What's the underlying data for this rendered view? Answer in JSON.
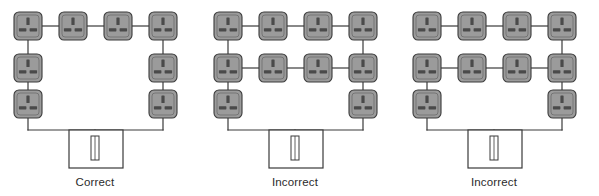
{
  "figure": {
    "background_color": "#ffffff",
    "width": 599,
    "height": 196
  },
  "style": {
    "socket_fill": "#9b9b9b",
    "socket_stroke": "#3a3a3a",
    "socket_slot_fill": "#4a4a4a",
    "wire_color": "#3a3a3a",
    "wire_width": 1.2,
    "consumer_unit_fill": "#ffffff",
    "consumer_unit_stroke": "#3a3a3a",
    "label_color": "#2b2b2b"
  },
  "icons": {
    "socket": "socket-outlet-icon",
    "consumer_unit": "consumer-unit-icon",
    "fuse": "fuse-icon"
  },
  "panels": [
    {
      "id": "panel-1",
      "label": "Correct",
      "origin_x": 0,
      "socket_count": 8,
      "description": "Complete ring: four top sockets, two on each side, both ends return to the consumer unit",
      "sockets": [
        {
          "name": "socket-top-1",
          "x": 28,
          "y": 26
        },
        {
          "name": "socket-top-2",
          "x": 73,
          "y": 26
        },
        {
          "name": "socket-top-3",
          "x": 118,
          "y": 26
        },
        {
          "name": "socket-top-4",
          "x": 163,
          "y": 26
        },
        {
          "name": "socket-left-mid",
          "x": 28,
          "y": 68
        },
        {
          "name": "socket-right-mid",
          "x": 163,
          "y": 68
        },
        {
          "name": "socket-left-bottom",
          "x": 28,
          "y": 104
        },
        {
          "name": "socket-right-bottom",
          "x": 163,
          "y": 104
        }
      ],
      "wires": [
        {
          "name": "wire-top-1-2",
          "x1": 42,
          "y1": 26,
          "x2": 59,
          "y2": 26
        },
        {
          "name": "wire-top-2-3",
          "x1": 87,
          "y1": 26,
          "x2": 104,
          "y2": 26
        },
        {
          "name": "wire-top-3-4",
          "x1": 132,
          "y1": 26,
          "x2": 149,
          "y2": 26
        },
        {
          "name": "wire-left-top-mid",
          "x1": 28,
          "y1": 40,
          "x2": 28,
          "y2": 54
        },
        {
          "name": "wire-left-mid-bottom",
          "x1": 28,
          "y1": 82,
          "x2": 28,
          "y2": 90
        },
        {
          "name": "wire-right-top-mid",
          "x1": 163,
          "y1": 40,
          "x2": 163,
          "y2": 54
        },
        {
          "name": "wire-right-mid-bottom",
          "x1": 163,
          "y1": 82,
          "x2": 163,
          "y2": 90
        },
        {
          "name": "wire-left-drop",
          "x1": 28,
          "y1": 118,
          "x2": 28,
          "y2": 130
        },
        {
          "name": "wire-right-drop",
          "x1": 163,
          "y1": 118,
          "x2": 163,
          "y2": 130
        },
        {
          "name": "wire-bus",
          "x1": 28,
          "y1": 130,
          "x2": 163,
          "y2": 130
        },
        {
          "name": "wire-feed",
          "x1": 95,
          "y1": 130,
          "x2": 95,
          "y2": 148
        }
      ],
      "consumer_unit": {
        "name": "consumer-unit",
        "x": 69,
        "y": 130,
        "width": 54,
        "height": 38,
        "fuse": {
          "name": "fuse",
          "x": 91,
          "y": 136,
          "width": 8,
          "height": 24
        }
      },
      "label_position": {
        "x": 95,
        "y": 186
      }
    },
    {
      "id": "panel-2",
      "label": "Incorrect",
      "origin_x": 200,
      "socket_count": 12,
      "description": "Ring with an additional interconnecting row of sockets bridging both legs",
      "sockets": [
        {
          "name": "socket-top-1",
          "x": 28,
          "y": 26
        },
        {
          "name": "socket-top-2",
          "x": 73,
          "y": 26
        },
        {
          "name": "socket-top-3",
          "x": 118,
          "y": 26
        },
        {
          "name": "socket-top-4",
          "x": 163,
          "y": 26
        },
        {
          "name": "socket-mid-1",
          "x": 28,
          "y": 68
        },
        {
          "name": "socket-mid-2",
          "x": 73,
          "y": 68
        },
        {
          "name": "socket-mid-3",
          "x": 118,
          "y": 68
        },
        {
          "name": "socket-mid-4",
          "x": 163,
          "y": 68
        },
        {
          "name": "socket-left-bottom",
          "x": 28,
          "y": 104
        },
        {
          "name": "socket-right-bottom",
          "x": 163,
          "y": 104
        }
      ],
      "wires": [
        {
          "name": "wire-top-1-2",
          "x1": 42,
          "y1": 26,
          "x2": 59,
          "y2": 26
        },
        {
          "name": "wire-top-2-3",
          "x1": 87,
          "y1": 26,
          "x2": 104,
          "y2": 26
        },
        {
          "name": "wire-top-3-4",
          "x1": 132,
          "y1": 26,
          "x2": 149,
          "y2": 26
        },
        {
          "name": "wire-mid-1-2",
          "x1": 42,
          "y1": 68,
          "x2": 59,
          "y2": 68
        },
        {
          "name": "wire-mid-2-3",
          "x1": 87,
          "y1": 68,
          "x2": 104,
          "y2": 68
        },
        {
          "name": "wire-mid-3-4",
          "x1": 132,
          "y1": 68,
          "x2": 149,
          "y2": 68
        },
        {
          "name": "wire-left-top-mid",
          "x1": 28,
          "y1": 40,
          "x2": 28,
          "y2": 54
        },
        {
          "name": "wire-left-mid-bottom",
          "x1": 28,
          "y1": 82,
          "x2": 28,
          "y2": 90
        },
        {
          "name": "wire-right-top-mid",
          "x1": 163,
          "y1": 40,
          "x2": 163,
          "y2": 54
        },
        {
          "name": "wire-right-mid-bottom",
          "x1": 163,
          "y1": 82,
          "x2": 163,
          "y2": 90
        },
        {
          "name": "wire-left-drop",
          "x1": 28,
          "y1": 118,
          "x2": 28,
          "y2": 130
        },
        {
          "name": "wire-right-drop",
          "x1": 163,
          "y1": 118,
          "x2": 163,
          "y2": 130
        },
        {
          "name": "wire-bus",
          "x1": 28,
          "y1": 130,
          "x2": 163,
          "y2": 130
        },
        {
          "name": "wire-feed",
          "x1": 95,
          "y1": 130,
          "x2": 95,
          "y2": 148
        }
      ],
      "consumer_unit": {
        "name": "consumer-unit",
        "x": 69,
        "y": 130,
        "width": 54,
        "height": 38,
        "fuse": {
          "name": "fuse",
          "x": 91,
          "y": 136,
          "width": 8,
          "height": 24
        }
      },
      "label_position": {
        "x": 95,
        "y": 186
      }
    },
    {
      "id": "panel-3",
      "label": "Incorrect",
      "origin_x": 399,
      "socket_count": 12,
      "description": "Broken ring: the left top socket is not connected down to the row below it",
      "sockets": [
        {
          "name": "socket-top-1",
          "x": 28,
          "y": 26
        },
        {
          "name": "socket-top-2",
          "x": 73,
          "y": 26
        },
        {
          "name": "socket-top-3",
          "x": 118,
          "y": 26
        },
        {
          "name": "socket-top-4",
          "x": 163,
          "y": 26
        },
        {
          "name": "socket-mid-1",
          "x": 28,
          "y": 68
        },
        {
          "name": "socket-mid-2",
          "x": 73,
          "y": 68
        },
        {
          "name": "socket-mid-3",
          "x": 118,
          "y": 68
        },
        {
          "name": "socket-mid-4",
          "x": 163,
          "y": 68
        },
        {
          "name": "socket-left-bottom",
          "x": 28,
          "y": 104
        },
        {
          "name": "socket-right-bottom",
          "x": 163,
          "y": 104
        }
      ],
      "wires": [
        {
          "name": "wire-top-1-2",
          "x1": 42,
          "y1": 26,
          "x2": 59,
          "y2": 26
        },
        {
          "name": "wire-top-2-3",
          "x1": 87,
          "y1": 26,
          "x2": 104,
          "y2": 26
        },
        {
          "name": "wire-top-3-4",
          "x1": 132,
          "y1": 26,
          "x2": 149,
          "y2": 26
        },
        {
          "name": "wire-mid-1-2",
          "x1": 42,
          "y1": 68,
          "x2": 59,
          "y2": 68
        },
        {
          "name": "wire-mid-2-3",
          "x1": 87,
          "y1": 68,
          "x2": 104,
          "y2": 68
        },
        {
          "name": "wire-mid-3-4",
          "x1": 132,
          "y1": 68,
          "x2": 149,
          "y2": 68
        },
        {
          "name": "wire-left-mid-bottom",
          "x1": 28,
          "y1": 82,
          "x2": 28,
          "y2": 90
        },
        {
          "name": "wire-right-top-mid",
          "x1": 163,
          "y1": 40,
          "x2": 163,
          "y2": 54
        },
        {
          "name": "wire-right-mid-bottom",
          "x1": 163,
          "y1": 82,
          "x2": 163,
          "y2": 90
        },
        {
          "name": "wire-left-drop",
          "x1": 28,
          "y1": 118,
          "x2": 28,
          "y2": 130
        },
        {
          "name": "wire-right-drop",
          "x1": 163,
          "y1": 118,
          "x2": 163,
          "y2": 130
        },
        {
          "name": "wire-bus",
          "x1": 28,
          "y1": 130,
          "x2": 163,
          "y2": 130
        },
        {
          "name": "wire-feed",
          "x1": 95,
          "y1": 130,
          "x2": 95,
          "y2": 148
        }
      ],
      "consumer_unit": {
        "name": "consumer-unit",
        "x": 69,
        "y": 130,
        "width": 54,
        "height": 38,
        "fuse": {
          "name": "fuse",
          "x": 91,
          "y": 136,
          "width": 8,
          "height": 24
        }
      },
      "label_position": {
        "x": 95,
        "y": 186
      }
    }
  ]
}
